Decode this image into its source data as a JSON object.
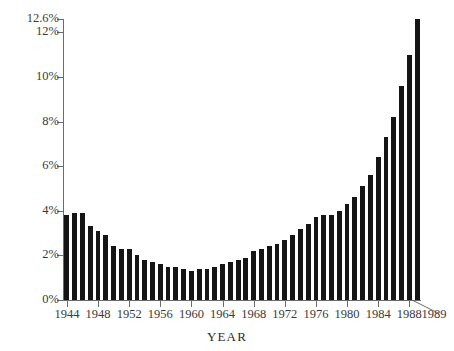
{
  "chart_data": {
    "type": "bar",
    "title": "",
    "xlabel": "YEAR",
    "ylabel": "",
    "ylim": [
      0,
      12.6
    ],
    "xlim": [
      1944,
      1989
    ],
    "grid": false,
    "legend": null,
    "bar_color": "#151515",
    "axis_color": "#6b6b6b",
    "y_ticks": [
      "0%",
      "2%",
      "4%",
      "6%",
      "8%",
      "10%",
      "12%",
      "12.6%"
    ],
    "y_tick_values": [
      0,
      2,
      4,
      6,
      8,
      10,
      12,
      12.6
    ],
    "x_ticks": [
      "1944",
      "1948",
      "1952",
      "1956",
      "1960",
      "1964",
      "1968",
      "1972",
      "1976",
      "1980",
      "1984",
      "1988",
      "1989"
    ],
    "x_tick_values": [
      1944,
      1948,
      1952,
      1956,
      1960,
      1964,
      1968,
      1972,
      1976,
      1980,
      1984,
      1988,
      1989
    ],
    "categories": [
      1944,
      1945,
      1946,
      1947,
      1948,
      1949,
      1950,
      1951,
      1952,
      1953,
      1954,
      1955,
      1956,
      1957,
      1958,
      1959,
      1960,
      1961,
      1962,
      1963,
      1964,
      1965,
      1966,
      1967,
      1968,
      1969,
      1970,
      1971,
      1972,
      1973,
      1974,
      1975,
      1976,
      1977,
      1978,
      1979,
      1980,
      1981,
      1982,
      1983,
      1984,
      1985,
      1986,
      1987,
      1988,
      1989
    ],
    "values": [
      3.8,
      3.9,
      3.9,
      3.3,
      3.1,
      2.9,
      2.4,
      2.3,
      2.3,
      2.0,
      1.8,
      1.7,
      1.6,
      1.5,
      1.5,
      1.4,
      1.3,
      1.4,
      1.4,
      1.5,
      1.6,
      1.7,
      1.8,
      1.9,
      2.2,
      2.3,
      2.4,
      2.5,
      2.7,
      2.9,
      3.2,
      3.4,
      3.7,
      3.8,
      3.8,
      4.0,
      4.3,
      4.6,
      5.1,
      5.6,
      6.4,
      7.3,
      8.2,
      9.6,
      11.0,
      12.6
    ]
  },
  "y_axis": {
    "ticks": [
      {
        "label": "12.6%",
        "value": 12.6
      },
      {
        "label": "12%",
        "value": 12
      },
      {
        "label": "10%",
        "value": 10
      },
      {
        "label": "8%",
        "value": 8
      },
      {
        "label": "6%",
        "value": 6
      },
      {
        "label": "4%",
        "value": 4
      },
      {
        "label": "2%",
        "value": 2
      },
      {
        "label": "0%",
        "value": 0
      }
    ]
  },
  "x_axis": {
    "title": "YEAR",
    "ticks": [
      {
        "label": "1944",
        "value": 1944
      },
      {
        "label": "1948",
        "value": 1948
      },
      {
        "label": "1952",
        "value": 1952
      },
      {
        "label": "1956",
        "value": 1956
      },
      {
        "label": "1960",
        "value": 1960
      },
      {
        "label": "1964",
        "value": 1964
      },
      {
        "label": "1968",
        "value": 1968
      },
      {
        "label": "1972",
        "value": 1972
      },
      {
        "label": "1976",
        "value": 1976
      },
      {
        "label": "1980",
        "value": 1980
      },
      {
        "label": "1984",
        "value": 1984
      },
      {
        "label": "1988",
        "value": 1988
      },
      {
        "label": "1989",
        "value": 1989
      }
    ]
  }
}
